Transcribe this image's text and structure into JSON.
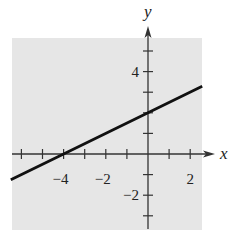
{
  "chart_data": {
    "type": "line",
    "title": "",
    "xlabel": "x",
    "ylabel": "y",
    "equation": "y = (1/2)x + 2",
    "series": [
      {
        "name": "line",
        "x": [
          -6.5,
          -4,
          0,
          2.57
        ],
        "y": [
          -1.25,
          0,
          2,
          3.29
        ]
      }
    ],
    "shading": {
      "region": "entire plot area",
      "color": "#e6e6e6"
    },
    "xlim": [
      -6.5,
      2.6
    ],
    "ylim": [
      -3.7,
      5.5
    ],
    "x_ticks": [
      -6,
      -5,
      -4,
      -3,
      -2,
      -1,
      1,
      2
    ],
    "y_ticks": [
      -3,
      -2,
      -1,
      1,
      2,
      3,
      4,
      5
    ],
    "x_tick_labels": [
      {
        "value": -4,
        "text": "−4"
      },
      {
        "value": -2,
        "text": "−2"
      },
      {
        "value": 2,
        "text": "2"
      }
    ],
    "y_tick_labels": [
      {
        "value": 4,
        "text": "4"
      },
      {
        "value": -2,
        "text": "−2"
      }
    ],
    "grid": false,
    "legend": null
  },
  "colors": {
    "background": "#ffffff",
    "shade": "#e6e6e6",
    "axis": "#333333",
    "line": "#111111"
  }
}
